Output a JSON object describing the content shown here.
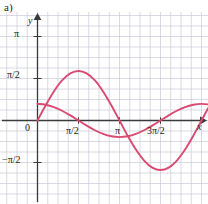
{
  "figure": {
    "panel_label": "a)",
    "background_color": "#ffffff",
    "grid_color": "#c9c6d6",
    "axis_color": "#3a3a3a",
    "curve_color": "#d94a72",
    "label_color": "#231f20"
  },
  "axes": {
    "x_label": "x",
    "y_label": "y",
    "origin_label": "0",
    "y_ticks": [
      {
        "label": "π",
        "value": 3.14159
      },
      {
        "label": "π/2",
        "value": 1.5708
      },
      {
        "label": "−π/2",
        "value": -1.5708
      }
    ],
    "x_ticks": [
      {
        "label": "π/2",
        "value": 1.5708
      },
      {
        "label": "π",
        "value": 3.14159
      },
      {
        "label": "3π/2",
        "value": 4.71239
      }
    ]
  },
  "chart_data": {
    "type": "line",
    "title": "",
    "xlabel": "x",
    "ylabel": "y",
    "xlim": [
      -0.35,
      6.6
    ],
    "ylim": [
      -2.45,
      3.6
    ],
    "grid": true,
    "legend": "none",
    "series": [
      {
        "name": "large-amplitude-sine",
        "color": "#d94a72",
        "formula": "y = 1.85 sin(x)",
        "amplitude": 1.85,
        "period": 6.28319,
        "phase": 0,
        "zero_crossings": [
          0,
          3.14159,
          6.28319
        ],
        "maximum": {
          "x": 1.5708,
          "y": 1.85
        },
        "minimum": {
          "x": 4.71239,
          "y": -1.85
        },
        "x": [
          0,
          0.314,
          0.628,
          0.942,
          1.257,
          1.571,
          1.885,
          2.199,
          2.513,
          2.827,
          3.142,
          3.456,
          3.77,
          4.084,
          4.398,
          4.712,
          5.027,
          5.341,
          5.655,
          5.969,
          6.283,
          6.6
        ],
        "y": [
          0,
          0.572,
          1.088,
          1.497,
          1.76,
          1.85,
          1.76,
          1.497,
          1.088,
          0.572,
          0,
          -0.572,
          -1.088,
          -1.497,
          -1.76,
          -1.85,
          -1.76,
          -1.497,
          -1.088,
          -0.572,
          0,
          0.573
        ]
      },
      {
        "name": "small-amplitude-cosine",
        "color": "#d94a72",
        "formula": "y = 0.62 cos(x)",
        "amplitude": 0.62,
        "period": 6.28319,
        "phase": 1.5708,
        "maximum": {
          "x": 0,
          "y": 0.62
        },
        "minimum": {
          "x": 3.14159,
          "y": -0.62
        },
        "x": [
          0,
          0.314,
          0.628,
          0.942,
          1.257,
          1.571,
          1.885,
          2.199,
          2.513,
          2.827,
          3.142,
          3.456,
          3.77,
          4.084,
          4.398,
          4.712,
          5.027,
          5.341,
          5.655,
          5.969,
          6.283,
          6.6
        ],
        "y": [
          0.62,
          0.59,
          0.502,
          0.365,
          0.192,
          0,
          -0.192,
          -0.365,
          -0.502,
          -0.59,
          -0.62,
          -0.59,
          -0.502,
          -0.365,
          -0.192,
          0,
          0.192,
          0.365,
          0.502,
          0.59,
          0.62,
          0.598
        ]
      }
    ]
  }
}
